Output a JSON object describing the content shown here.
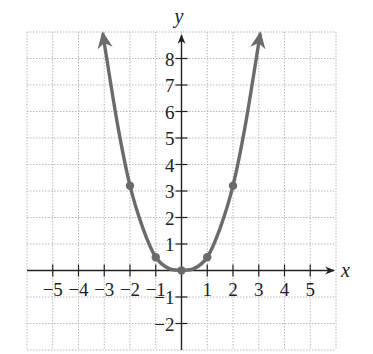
{
  "chart_data": {
    "type": "line",
    "title": "",
    "xlabel": "x",
    "ylabel": "y",
    "xlim": [
      -6,
      6
    ],
    "ylim": [
      -3,
      9
    ],
    "grid": true,
    "grid_style": "dotted",
    "x_ticks": [
      -5,
      -4,
      -3,
      -2,
      -1,
      1,
      2,
      3,
      4,
      5
    ],
    "y_ticks": [
      -2,
      -1,
      1,
      2,
      3,
      4,
      5,
      6,
      7,
      8
    ],
    "x_tick_labels": [
      "−5",
      "−4",
      "−3",
      "−2",
      "−1",
      "1",
      "2",
      "3",
      "4",
      "5"
    ],
    "y_tick_labels": [
      "−2",
      "−1",
      "1",
      "2",
      "3",
      "4",
      "5",
      "6",
      "7",
      "8"
    ],
    "series": [
      {
        "name": "parabola",
        "color": "#6b6b6b",
        "marked_points": [
          {
            "x": -2,
            "y": 3.2
          },
          {
            "x": -1,
            "y": 0.5
          },
          {
            "x": 0,
            "y": 0
          },
          {
            "x": 1,
            "y": 0.5
          },
          {
            "x": 2,
            "y": 3.2
          }
        ],
        "curve_points": [
          {
            "x": -3.05,
            "y": 8.9
          },
          {
            "x": -2.5,
            "y": 5.6
          },
          {
            "x": -2,
            "y": 3.2
          },
          {
            "x": -1.5,
            "y": 1.6
          },
          {
            "x": -1,
            "y": 0.5
          },
          {
            "x": -0.5,
            "y": 0.08
          },
          {
            "x": 0,
            "y": 0
          },
          {
            "x": 0.5,
            "y": 0.08
          },
          {
            "x": 1,
            "y": 0.5
          },
          {
            "x": 1.5,
            "y": 1.6
          },
          {
            "x": 2,
            "y": 3.2
          },
          {
            "x": 2.5,
            "y": 5.6
          },
          {
            "x": 3.05,
            "y": 8.9
          }
        ],
        "arrows_at_ends": true
      }
    ]
  }
}
